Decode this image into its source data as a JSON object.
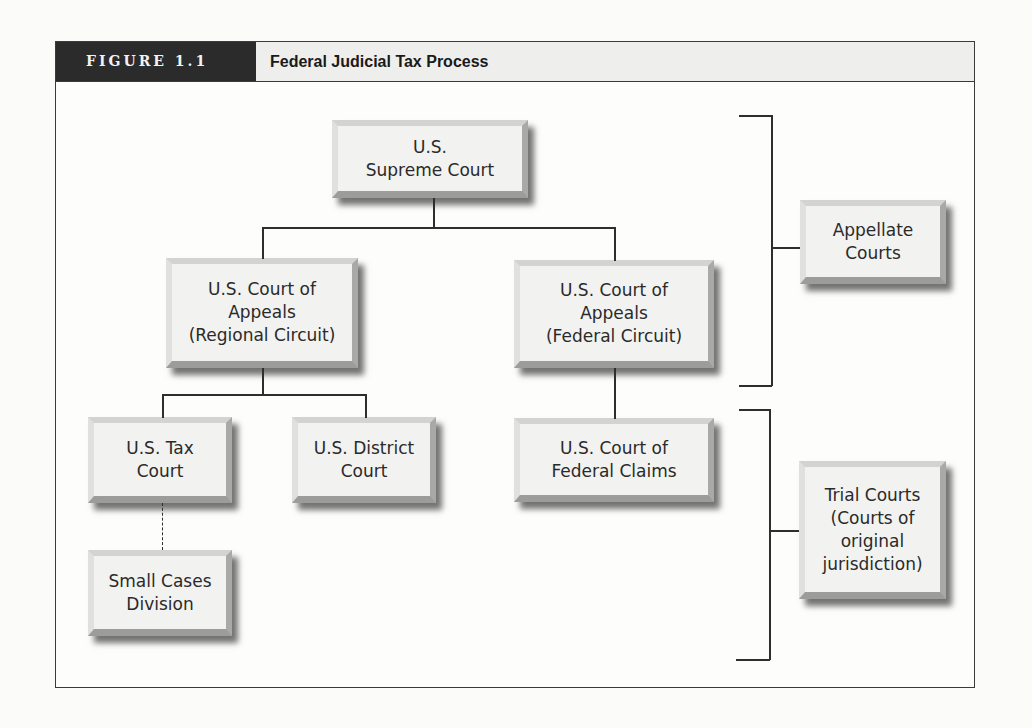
{
  "figure": {
    "label": "FIGURE 1.1",
    "title": "Federal Judicial Tax Process"
  },
  "nodes": {
    "supreme_court": "U.S.\nSupreme Court",
    "appeals_regional": "U.S. Court of\nAppeals\n(Regional Circuit)",
    "appeals_federal": "U.S. Court of\nAppeals\n(Federal Circuit)",
    "tax_court": "U.S. Tax\nCourt",
    "district_court": "U.S. District\nCourt",
    "federal_claims": "U.S. Court of\nFederal Claims",
    "small_cases": "Small Cases\nDivision"
  },
  "groups": {
    "appellate": "Appellate\nCourts",
    "trial": "Trial Courts\n(Courts of\noriginal\njurisdiction)"
  },
  "colors": {
    "label_bg": "#2b2b2b",
    "header_bg": "#eeeeec",
    "box_face": "#f2f2f1",
    "line": "#2e2e2e"
  }
}
